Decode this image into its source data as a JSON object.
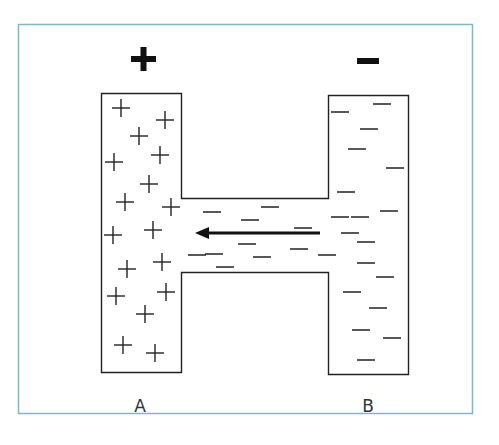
{
  "diagram": {
    "frame_color": "#7ab8cc",
    "stroke_color": "#222222",
    "terminals": {
      "positive_symbol": "+",
      "negative_symbol": "−"
    },
    "labels": {
      "left": "A",
      "right": "B"
    },
    "left_charges": [
      [
        121,
        108
      ],
      [
        165,
        120
      ],
      [
        139,
        136
      ],
      [
        160,
        155
      ],
      [
        114,
        162
      ],
      [
        149,
        184
      ],
      [
        125,
        202
      ],
      [
        171,
        207
      ],
      [
        113,
        235
      ],
      [
        153,
        230
      ],
      [
        127,
        269
      ],
      [
        162,
        262
      ],
      [
        116,
        296
      ],
      [
        166,
        292
      ],
      [
        145,
        314
      ],
      [
        123,
        345
      ],
      [
        155,
        353
      ]
    ],
    "right_charges": [
      [
        340,
        112
      ],
      [
        382,
        104
      ],
      [
        369,
        129
      ],
      [
        357,
        149
      ],
      [
        395,
        168
      ],
      [
        346,
        192
      ],
      [
        389,
        211
      ],
      [
        340,
        217
      ],
      [
        366,
        242
      ],
      [
        385,
        277
      ],
      [
        352,
        292
      ],
      [
        378,
        308
      ],
      [
        361,
        330
      ],
      [
        392,
        338
      ],
      [
        366,
        360
      ]
    ],
    "channel_charges": [
      [
        212,
        212
      ],
      [
        270,
        207
      ],
      [
        303,
        228
      ],
      [
        250,
        220
      ],
      [
        360,
        217
      ],
      [
        247,
        244
      ],
      [
        214,
        254
      ],
      [
        262,
        257
      ],
      [
        299,
        249
      ],
      [
        327,
        255
      ],
      [
        225,
        267
      ],
      [
        366,
        263
      ],
      [
        350,
        233
      ],
      [
        197,
        255
      ]
    ],
    "arrow": {
      "direction": "right-to-left",
      "from": [
        320,
        233
      ],
      "to": [
        195,
        233
      ]
    }
  }
}
